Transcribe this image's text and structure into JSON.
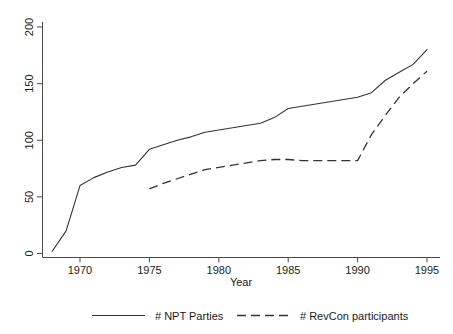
{
  "chart_data": {
    "type": "line",
    "title": "",
    "xlabel": "Year",
    "ylabel": "",
    "xlim": [
      1968,
      1995
    ],
    "ylim": [
      0,
      200
    ],
    "grid": false,
    "legend_position": "bottom",
    "x_ticks": [
      1970,
      1975,
      1980,
      1985,
      1990,
      1995
    ],
    "x_tick_labels": [
      "1970",
      "1975",
      "1980",
      "1985",
      "1990",
      "1995"
    ],
    "y_ticks": [
      0,
      50,
      100,
      150,
      200
    ],
    "y_tick_labels": [
      "0",
      "50",
      "100",
      "150",
      "200"
    ],
    "series": [
      {
        "name": "# NPT Parties",
        "style": "solid",
        "color": "#333333",
        "x": [
          1968,
          1969,
          1970,
          1971,
          1972,
          1973,
          1974,
          1975,
          1976,
          1977,
          1978,
          1979,
          1980,
          1981,
          1982,
          1983,
          1984,
          1985,
          1986,
          1987,
          1988,
          1989,
          1990,
          1991,
          1992,
          1993,
          1994,
          1995
        ],
        "values": [
          2,
          20,
          60,
          67,
          72,
          76,
          78,
          92,
          96,
          100,
          103,
          107,
          109,
          111,
          113,
          115,
          120,
          128,
          130,
          132,
          134,
          136,
          138,
          142,
          153,
          160,
          167,
          180
        ]
      },
      {
        "name": "# RevCon participants",
        "style": "dashed",
        "color": "#333333",
        "x": [
          1975,
          1976,
          1977,
          1978,
          1979,
          1980,
          1981,
          1982,
          1983,
          1984,
          1985,
          1986,
          1987,
          1988,
          1989,
          1990,
          1991,
          1992,
          1993,
          1994,
          1995
        ],
        "values": [
          57,
          62,
          66,
          70,
          74,
          76,
          78,
          80,
          82,
          83,
          83,
          82,
          82,
          82,
          82,
          82,
          105,
          122,
          138,
          150,
          161
        ]
      }
    ]
  },
  "axis": {
    "x_title": "Year"
  },
  "legend": {
    "items": [
      {
        "label": "# NPT Parties",
        "style": "solid"
      },
      {
        "label": "# RevCon participants",
        "style": "dashed"
      }
    ]
  }
}
